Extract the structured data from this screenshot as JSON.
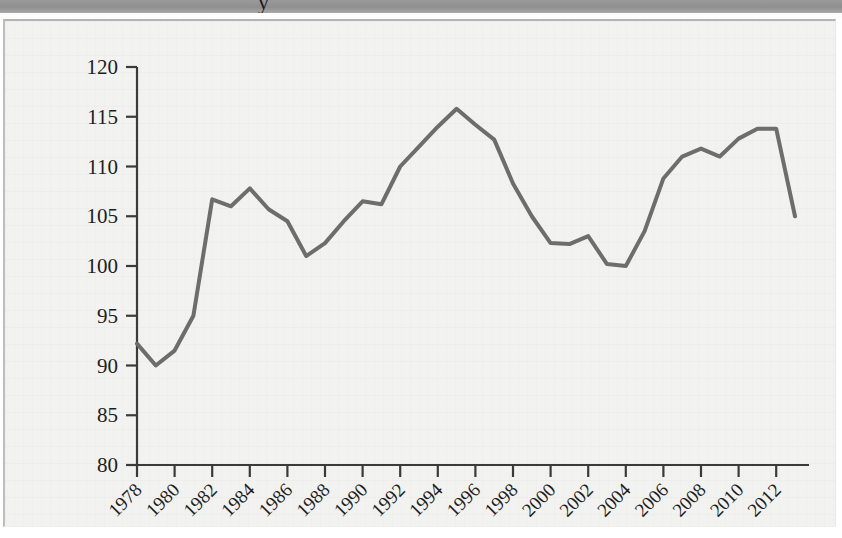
{
  "page": {
    "top_band_glyph": "y",
    "background_color": "#f2f2f1",
    "band_color": "#979797"
  },
  "chart_data": {
    "type": "line",
    "title": "",
    "subtitle": "",
    "xlabel": "",
    "ylabel": "",
    "xlim": [
      1978,
      2013
    ],
    "ylim": [
      80,
      120
    ],
    "ytick_step": 5,
    "xtick_step": 2,
    "grid": false,
    "legend": null,
    "line_color": "#6d6d6d",
    "line_width": 4,
    "axis_color": "#3a3a3a",
    "ytick_labels": [
      "80",
      "85",
      "90",
      "95",
      "100",
      "105",
      "110",
      "115",
      "120"
    ],
    "ytick_values": [
      80,
      85,
      90,
      95,
      100,
      105,
      110,
      115,
      120
    ],
    "xtick_labels": [
      "1978",
      "1980",
      "1982",
      "1984",
      "1986",
      "1988",
      "1990",
      "1992",
      "1994",
      "1996",
      "1998",
      "2000",
      "2002",
      "2004",
      "2006",
      "2008",
      "2010",
      "2012"
    ],
    "xtick_values": [
      1978,
      1980,
      1982,
      1984,
      1986,
      1988,
      1990,
      1992,
      1994,
      1996,
      1998,
      2000,
      2002,
      2004,
      2006,
      2008,
      2010,
      2012
    ],
    "xtick_rotation": 45,
    "x": [
      1978,
      1979,
      1980,
      1981,
      1982,
      1983,
      1984,
      1985,
      1986,
      1987,
      1988,
      1989,
      1990,
      1991,
      1992,
      1993,
      1994,
      1995,
      1996,
      1997,
      1998,
      1999,
      2000,
      2001,
      2002,
      2003,
      2004,
      2005,
      2006,
      2007,
      2008,
      2009,
      2010,
      2011,
      2012,
      2013
    ],
    "series": [
      {
        "name": "index",
        "values": [
          92.2,
          90.0,
          91.5,
          95.0,
          106.7,
          106.0,
          107.8,
          105.7,
          104.5,
          101.0,
          102.3,
          104.5,
          106.5,
          106.2,
          110.0,
          112.0,
          114.0,
          115.8,
          114.2,
          112.7,
          108.3,
          105.0,
          102.3,
          102.2,
          103.0,
          100.2,
          100.0,
          103.5,
          108.8,
          111.0,
          111.8,
          111.0,
          112.8,
          113.8,
          113.8,
          105.0
        ]
      }
    ]
  }
}
